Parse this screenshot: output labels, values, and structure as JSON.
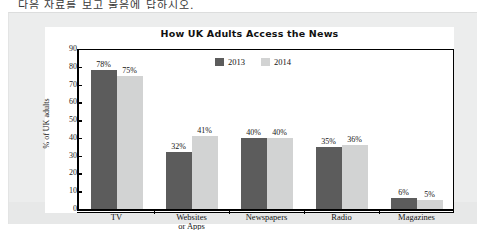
{
  "scan": {
    "top_text_fragment": "다음 자료를 보고 물음에 답하시오."
  },
  "chart_data": {
    "type": "bar",
    "title": "How UK Adults Access the News",
    "xlabel": "",
    "ylabel": "% of UK adults",
    "ylim": [
      0,
      90
    ],
    "yticks": [
      90,
      80,
      70,
      60,
      50,
      40,
      30,
      20,
      10,
      0
    ],
    "grid": false,
    "legend_position": "top-center-inside",
    "categories": [
      "TV",
      "Websites or Apps",
      "Newspapers",
      "Radio",
      "Magazines"
    ],
    "category_lines": [
      [
        "TV"
      ],
      [
        "Websites",
        "or Apps"
      ],
      [
        "Newspapers"
      ],
      [
        "Radio"
      ],
      [
        "Magazines"
      ]
    ],
    "series": [
      {
        "name": "2013",
        "color": "#5c5c5c",
        "values": [
          78,
          32,
          40,
          35,
          6
        ],
        "labels": [
          "78%",
          "32%",
          "40%",
          "35%",
          "6%"
        ]
      },
      {
        "name": "2014",
        "color": "#d2d3d3",
        "values": [
          75,
          41,
          40,
          36,
          5
        ],
        "labels": [
          "75%",
          "41%",
          "40%",
          "36%",
          "5%"
        ]
      }
    ]
  },
  "colors": {
    "series_2013": "#5c5c5c",
    "series_2014": "#d2d3d3",
    "panel_background": "#eceded",
    "chart_background": "#ffffff",
    "axis": "#000000"
  }
}
